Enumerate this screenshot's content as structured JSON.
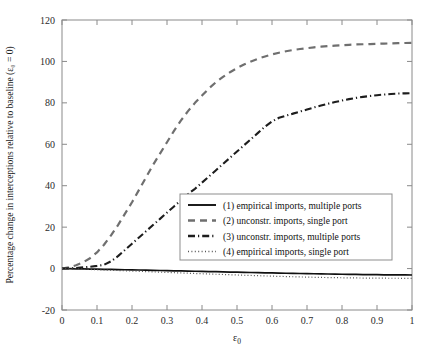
{
  "chart_data": {
    "type": "line",
    "title": "",
    "xlabel": "ε₀",
    "ylabel": "Percentage change in interceptions relative to baseline (ε₀ = 0)",
    "xlim": [
      0,
      1
    ],
    "ylim": [
      -20,
      120
    ],
    "xticks": [
      "0",
      "0.1",
      "0.2",
      "0.3",
      "0.4",
      "0.5",
      "0.6",
      "0.7",
      "0.8",
      "0.9",
      "1"
    ],
    "xtick_values": [
      0,
      0.1,
      0.2,
      0.3,
      0.4,
      0.5,
      0.6,
      0.7,
      0.8,
      0.9,
      1
    ],
    "yticks": [
      "-20",
      "0",
      "20",
      "40",
      "60",
      "80",
      "100",
      "120"
    ],
    "ytick_values": [
      -20,
      0,
      20,
      40,
      60,
      80,
      100,
      120
    ],
    "grid": false,
    "legend_position": "center-right",
    "x": [
      0,
      0.02,
      0.04,
      0.06,
      0.08,
      0.1,
      0.12,
      0.14,
      0.16,
      0.18,
      0.2,
      0.22,
      0.24,
      0.26,
      0.28,
      0.3,
      0.32,
      0.34,
      0.36,
      0.38,
      0.4,
      0.42,
      0.44,
      0.46,
      0.48,
      0.5,
      0.52,
      0.54,
      0.56,
      0.58,
      0.6,
      0.62,
      0.64,
      0.66,
      0.68,
      0.7,
      0.72,
      0.74,
      0.76,
      0.78,
      0.8,
      0.82,
      0.84,
      0.86,
      0.88,
      0.9,
      0.92,
      0.94,
      0.96,
      0.98,
      1
    ],
    "series": [
      {
        "name": "(1) empirical imports, multiple ports",
        "style": "solid",
        "color": "#101010",
        "values": [
          0,
          -0.05,
          -0.1,
          -0.16,
          -0.22,
          -0.28,
          -0.35,
          -0.42,
          -0.49,
          -0.56,
          -0.63,
          -0.7,
          -0.77,
          -0.85,
          -0.92,
          -1.0,
          -1.07,
          -1.15,
          -1.22,
          -1.3,
          -1.37,
          -1.45,
          -1.52,
          -1.6,
          -1.67,
          -1.75,
          -1.82,
          -1.9,
          -1.97,
          -2.04,
          -2.11,
          -2.18,
          -2.25,
          -2.32,
          -2.38,
          -2.45,
          -2.51,
          -2.57,
          -2.63,
          -2.68,
          -2.74,
          -2.79,
          -2.84,
          -2.88,
          -2.92,
          -2.96,
          -3.0,
          -3.03,
          -3.06,
          -3.08,
          -3.1
        ]
      },
      {
        "name": "(2) unconstr. imports, single port",
        "style": "dashed",
        "color": "#6f6f6f",
        "values": [
          0,
          0.6,
          1.6,
          3.0,
          5.0,
          7.8,
          11.5,
          16.0,
          21.0,
          26.5,
          32.0,
          38.0,
          44.0,
          50.0,
          55.5,
          61.0,
          66.5,
          71.5,
          76.0,
          80.0,
          83.5,
          87.0,
          90.0,
          92.5,
          94.8,
          96.8,
          98.5,
          100.0,
          101.3,
          102.4,
          103.4,
          104.2,
          104.9,
          105.5,
          106.0,
          106.4,
          106.8,
          107.1,
          107.4,
          107.6,
          107.8,
          108.0,
          108.2,
          108.3,
          108.4,
          108.5,
          108.6,
          108.7,
          108.8,
          108.9,
          109.0
        ]
      },
      {
        "name": "(3) unconstr. imports, multiple ports",
        "style": "dashdot",
        "color": "#1d1d1d",
        "values": [
          0,
          0.1,
          0.3,
          0.6,
          0.9,
          1.3,
          1.8,
          3.5,
          6.0,
          9.0,
          12.0,
          15.0,
          18.0,
          21.0,
          24.0,
          27.0,
          30.0,
          33.0,
          36.0,
          38.5,
          41.5,
          44.5,
          47.5,
          50.5,
          53.5,
          56.5,
          59.5,
          62.5,
          65.5,
          68.5,
          71.0,
          72.8,
          73.8,
          74.8,
          75.8,
          76.8,
          77.8,
          78.7,
          79.6,
          80.4,
          81.1,
          81.8,
          82.4,
          82.9,
          83.3,
          83.7,
          84.0,
          84.3,
          84.5,
          84.6,
          84.7
        ]
      },
      {
        "name": "(4) empirical imports, single port",
        "style": "dotted",
        "color": "#555555",
        "values": [
          0,
          -0.1,
          -0.2,
          -0.32,
          -0.44,
          -0.56,
          -0.69,
          -0.82,
          -0.95,
          -1.08,
          -1.21,
          -1.34,
          -1.47,
          -1.6,
          -1.73,
          -1.86,
          -1.99,
          -2.12,
          -2.25,
          -2.38,
          -2.5,
          -2.62,
          -2.74,
          -2.86,
          -2.98,
          -3.1,
          -3.22,
          -3.33,
          -3.44,
          -3.55,
          -3.66,
          -3.76,
          -3.86,
          -3.95,
          -4.04,
          -4.12,
          -4.2,
          -4.27,
          -4.33,
          -4.39,
          -4.44,
          -4.49,
          -4.53,
          -4.57,
          -4.6,
          -4.63,
          -4.65,
          -4.67,
          -4.68,
          -4.69,
          -4.7
        ]
      }
    ]
  }
}
